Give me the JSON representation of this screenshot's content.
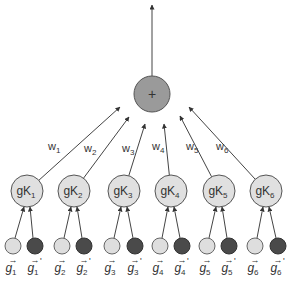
{
  "diagram": {
    "sum_node": {
      "label": "+",
      "cx": 152,
      "cy": 94,
      "r": 18,
      "fill": "#9a9a9a"
    },
    "output_arrow": {
      "x": 152,
      "y1": 76,
      "y2": 5
    },
    "kernel_nodes": [
      {
        "base": "gK",
        "sub": "1",
        "cx": 27,
        "cy": 191,
        "weight": "w",
        "wsub": "1",
        "wx": 48,
        "wy": 150,
        "ax": 120,
        "ay": 107
      },
      {
        "base": "gK",
        "sub": "2",
        "cx": 74,
        "cy": 191,
        "weight": "w",
        "wsub": "2",
        "wx": 84,
        "wy": 152,
        "ax": 129,
        "ay": 117
      },
      {
        "base": "gK",
        "sub": "3",
        "cx": 124,
        "cy": 191,
        "weight": "w",
        "wsub": "3",
        "wx": 122,
        "wy": 152,
        "ax": 145,
        "ay": 124
      },
      {
        "base": "gK",
        "sub": "4",
        "cx": 171,
        "cy": 191,
        "weight": "w",
        "wsub": "4",
        "wx": 152,
        "wy": 150,
        "ax": 164,
        "ay": 124
      },
      {
        "base": "gK",
        "sub": "5",
        "cx": 219,
        "cy": 191,
        "weight": "w",
        "wsub": "5",
        "wx": 186,
        "wy": 150,
        "ax": 180,
        "ay": 116
      },
      {
        "base": "gK",
        "sub": "6",
        "cx": 266,
        "cy": 191,
        "weight": "w",
        "wsub": "6",
        "wx": 216,
        "wy": 150,
        "ax": 189,
        "ay": 107
      }
    ],
    "kernel_fill": "#e0e0e0",
    "input_pairs": [
      {
        "lx": 13,
        "dx": 35,
        "label": "g",
        "sub": "1"
      },
      {
        "lx": 62,
        "dx": 84,
        "label": "g",
        "sub": "2"
      },
      {
        "lx": 112,
        "dx": 135,
        "label": "g",
        "sub": "3"
      },
      {
        "lx": 160,
        "dx": 182,
        "label": "g",
        "sub": "4"
      },
      {
        "lx": 207,
        "dx": 229,
        "label": "g",
        "sub": "5"
      },
      {
        "lx": 255,
        "dx": 278,
        "label": "g",
        "sub": "6"
      }
    ],
    "input_cy": 246,
    "input_r": 8,
    "light_fill": "#dedede",
    "dark_fill": "#4a4a4a",
    "prime_mark": "'",
    "vector_arrow": "→"
  }
}
